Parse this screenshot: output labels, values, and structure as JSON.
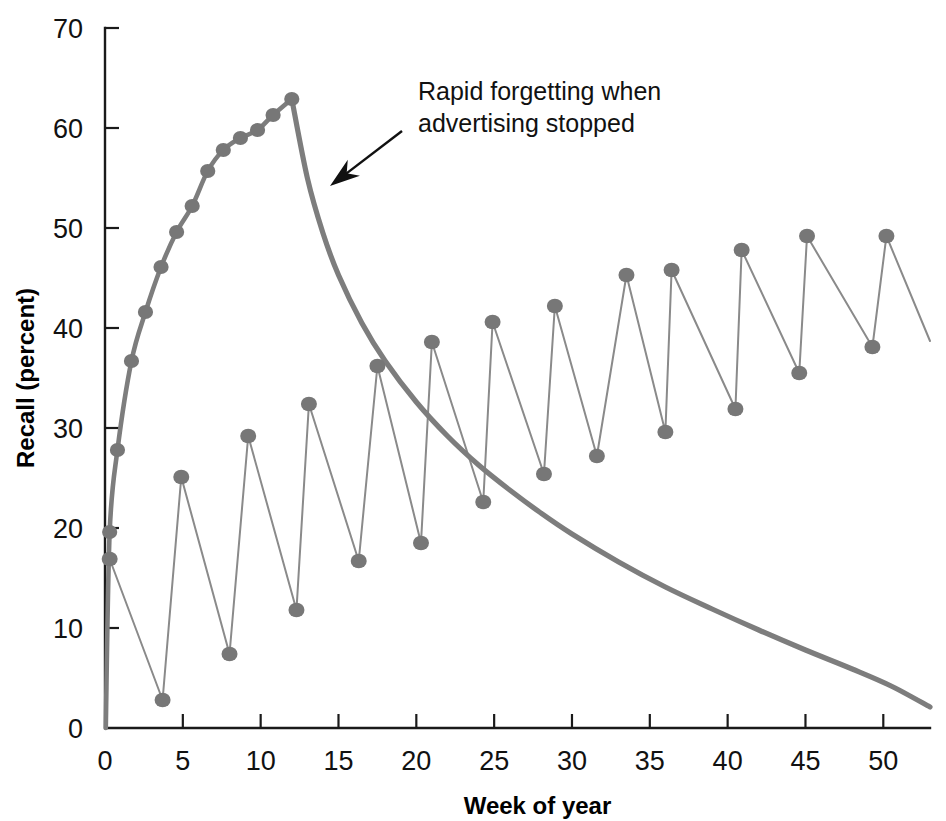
{
  "chart_data": {
    "type": "line",
    "title": "",
    "xlabel": "Week of year",
    "ylabel": "Recall (percent)",
    "xlim": [
      0,
      53
    ],
    "ylim": [
      0,
      70
    ],
    "xticks": [
      0,
      5,
      10,
      15,
      20,
      25,
      30,
      35,
      40,
      45,
      50
    ],
    "xtick_labels": [
      "0",
      "5",
      "10",
      "15",
      "20",
      "25",
      "30",
      "35",
      "40",
      "45",
      "50"
    ],
    "yticks": [
      0,
      10,
      20,
      30,
      40,
      50,
      60,
      70
    ],
    "ytick_labels": [
      "0",
      "10",
      "20",
      "30",
      "40",
      "50",
      "60",
      "70"
    ],
    "grid": false,
    "legend": "none",
    "marker_color": "#777777",
    "line_color": "#8a8a8a",
    "curve_color": "#7d7d7d",
    "axis_color": "#1a1a1a",
    "series": [
      {
        "name": "Continuous advertising then stopped",
        "style": "line-with-markers-then-smooth-decay",
        "points": [
          {
            "x": 0.3,
            "y": 19.6
          },
          {
            "x": 0.8,
            "y": 27.8
          },
          {
            "x": 1.7,
            "y": 36.7
          },
          {
            "x": 2.6,
            "y": 41.6
          },
          {
            "x": 3.6,
            "y": 46.1
          },
          {
            "x": 4.6,
            "y": 49.6
          },
          {
            "x": 5.6,
            "y": 52.2
          },
          {
            "x": 6.6,
            "y": 55.7
          },
          {
            "x": 7.6,
            "y": 57.8
          },
          {
            "x": 8.7,
            "y": 59.0
          },
          {
            "x": 9.8,
            "y": 59.8
          },
          {
            "x": 10.8,
            "y": 61.3
          },
          {
            "x": 12.0,
            "y": 62.9
          }
        ],
        "decay_from": {
          "x": 12.0,
          "y": 62.9
        },
        "decay_to": {
          "x": 53.0,
          "y": 2.1
        },
        "decay_samples": [
          {
            "x": 12.0,
            "y": 62.9
          },
          {
            "x": 13.0,
            "y": 55.0
          },
          {
            "x": 14.0,
            "y": 49.5
          },
          {
            "x": 15.0,
            "y": 45.3
          },
          {
            "x": 16.5,
            "y": 40.5
          },
          {
            "x": 18.0,
            "y": 36.7
          },
          {
            "x": 20.0,
            "y": 32.6
          },
          {
            "x": 22.0,
            "y": 29.2
          },
          {
            "x": 24.0,
            "y": 26.3
          },
          {
            "x": 26.0,
            "y": 23.8
          },
          {
            "x": 28.0,
            "y": 21.5
          },
          {
            "x": 30.0,
            "y": 19.4
          },
          {
            "x": 33.0,
            "y": 16.6
          },
          {
            "x": 36.0,
            "y": 14.1
          },
          {
            "x": 39.0,
            "y": 11.9
          },
          {
            "x": 42.0,
            "y": 9.8
          },
          {
            "x": 45.0,
            "y": 7.8
          },
          {
            "x": 48.0,
            "y": 5.9
          },
          {
            "x": 50.5,
            "y": 4.2
          },
          {
            "x": 53.0,
            "y": 2.1
          }
        ]
      },
      {
        "name": "Pulsed (flighted) advertising",
        "style": "sawtooth-line-with-markers",
        "points": [
          {
            "x": 0.3,
            "y": 16.9
          },
          {
            "x": 3.7,
            "y": 2.8
          },
          {
            "x": 4.9,
            "y": 25.1
          },
          {
            "x": 8.0,
            "y": 7.4
          },
          {
            "x": 9.2,
            "y": 29.2
          },
          {
            "x": 12.3,
            "y": 11.8
          },
          {
            "x": 13.1,
            "y": 32.4
          },
          {
            "x": 16.3,
            "y": 16.7
          },
          {
            "x": 17.5,
            "y": 36.2
          },
          {
            "x": 20.3,
            "y": 18.5
          },
          {
            "x": 21.0,
            "y": 38.6
          },
          {
            "x": 24.3,
            "y": 22.6
          },
          {
            "x": 24.9,
            "y": 40.6
          },
          {
            "x": 28.2,
            "y": 25.4
          },
          {
            "x": 28.9,
            "y": 42.2
          },
          {
            "x": 31.6,
            "y": 27.2
          },
          {
            "x": 33.5,
            "y": 45.3
          },
          {
            "x": 36.0,
            "y": 29.6
          },
          {
            "x": 36.4,
            "y": 45.8
          },
          {
            "x": 40.5,
            "y": 31.9
          },
          {
            "x": 40.9,
            "y": 47.8
          },
          {
            "x": 44.6,
            "y": 35.5
          },
          {
            "x": 45.1,
            "y": 49.2
          },
          {
            "x": 49.3,
            "y": 38.1
          },
          {
            "x": 50.2,
            "y": 49.2
          },
          {
            "x": 53.0,
            "y": 38.7
          }
        ]
      }
    ],
    "annotations": [
      {
        "name": "rapid-forgetting-annotation",
        "line1": "Rapid forgetting when",
        "line2": "advertising stopped",
        "text_x": 418,
        "text_y": 100,
        "arrow_tail": {
          "x": 402,
          "y": 131
        },
        "arrow_tip": {
          "x": 330,
          "y": 186
        }
      }
    ]
  }
}
